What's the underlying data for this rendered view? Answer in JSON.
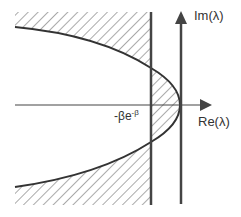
{
  "diagram": {
    "title": "",
    "axes": {
      "real_axis_label": "Re(λ)",
      "imag_axis_label": "Im(λ)"
    },
    "boundary_label": {
      "base": "-βe",
      "exponent": "-β"
    },
    "colors": {
      "stroke": "#444444",
      "hatch": "#555555",
      "background": "#ffffff"
    },
    "regions": [
      {
        "name": "hatched-left-outside-parabola",
        "description": "Region left of Re(λ) = -βe^-β outside the parabola"
      },
      {
        "name": "hatched-between-line-and-parabola",
        "description": "Region right of Re(λ) = -βe^-β inside the parabola"
      }
    ]
  }
}
